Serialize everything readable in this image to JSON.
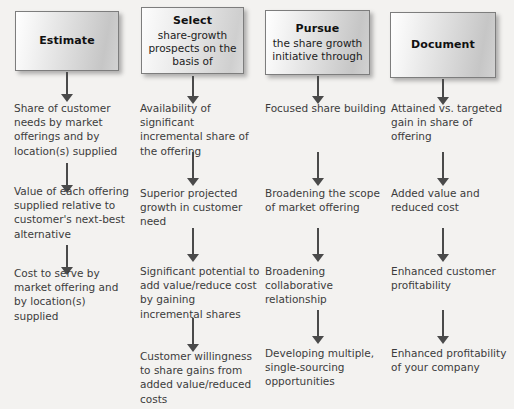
{
  "page": {
    "background_color": "#f3f2f0",
    "text_color": "#3c3c3c",
    "arrow_color": "#4a4a4a"
  },
  "columns": [
    {
      "header": {
        "title": "Estimate",
        "subtitle": ""
      },
      "items": [
        "Share of customer needs by market offerings and by location(s) supplied",
        "Value of each offering supplied relative to customer's next-best alternative",
        "Cost to serve by market offering and by location(s) supplied"
      ]
    },
    {
      "header": {
        "title": "Select",
        "subtitle": "share-growth prospects on the basis of"
      },
      "items": [
        "Availability of significant incremental share of the offering",
        "Superior projected growth in customer need",
        "Significant potential to add value/reduce cost by gaining incremental shares",
        "Customer willingness to share gains from added value/reduced costs"
      ]
    },
    {
      "header": {
        "title": "Pursue",
        "subtitle": "the share growth initiative through"
      },
      "items": [
        "Focused share building",
        "Broadening the scope of market offering",
        "Broadening collaborative relationship",
        "Developing multiple, single-sourcing opportunities"
      ]
    },
    {
      "header": {
        "title": "Document",
        "subtitle": ""
      },
      "items": [
        "Attained vs. targeted gain in share of offering",
        "Added value and reduced cost",
        "Enhanced customer profitability",
        "Enhanced profitability of your company"
      ]
    }
  ]
}
